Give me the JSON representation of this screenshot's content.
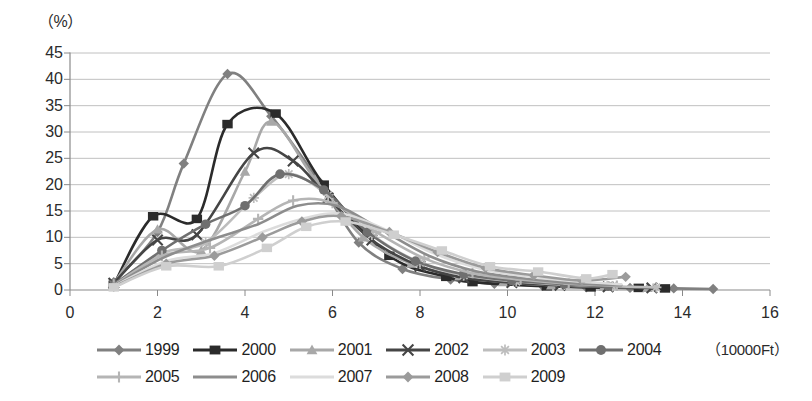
{
  "axes": {
    "y_unit": "（%）",
    "x_unit": "（10000Ft）",
    "y_ticks": [
      "0",
      "5",
      "10",
      "15",
      "20",
      "25",
      "30",
      "35",
      "40",
      "45"
    ],
    "x_ticks": [
      "0",
      "2",
      "4",
      "6",
      "8",
      "10",
      "12",
      "14",
      "16"
    ]
  },
  "legend": {
    "row1": [
      {
        "label": "1999",
        "marker": "diamond",
        "color": "#808080"
      },
      {
        "label": "2000",
        "marker": "square",
        "color": "#2b2b2b"
      },
      {
        "label": "2001",
        "marker": "triangle",
        "color": "#a8a8a8"
      },
      {
        "label": "2002",
        "marker": "cross-x",
        "color": "#454545"
      },
      {
        "label": "2003",
        "marker": "asterisk",
        "color": "#bdbdbd"
      },
      {
        "label": "2004",
        "marker": "circle",
        "color": "#6f6f6f"
      }
    ],
    "row2": [
      {
        "label": "2005",
        "marker": "plus",
        "color": "#b5b5b5"
      },
      {
        "label": "2006",
        "marker": "line",
        "color": "#8d8d8d"
      },
      {
        "label": "2007",
        "marker": "line",
        "color": "#dcdcdc"
      },
      {
        "label": "2008",
        "marker": "diamond",
        "color": "#9b9b9b"
      },
      {
        "label": "2009",
        "marker": "square",
        "color": "#cfcfcf"
      }
    ]
  },
  "chart_data": {
    "type": "line",
    "title": "",
    "xlabel": "（10000Ft）",
    "ylabel": "（%）",
    "xlim": [
      0,
      16
    ],
    "ylim": [
      0,
      45
    ],
    "xtick_step": 2,
    "ytick_step": 5,
    "grid": "horizontal",
    "legend_position": "bottom",
    "x": [
      1,
      2,
      3,
      4,
      5,
      6,
      7,
      8,
      9,
      10,
      11,
      12,
      13,
      14,
      15
    ],
    "series": [
      {
        "name": "1999",
        "color": "#808080",
        "marker": "diamond",
        "x": [
          1.0,
          2.0,
          2.6,
          3.6,
          4.6,
          5.7,
          6.6,
          7.6,
          8.7,
          9.7,
          10.8,
          11.8,
          12.8,
          13.8,
          14.7
        ],
        "values": [
          1.5,
          11.0,
          24.0,
          41.0,
          33.0,
          20.5,
          9.0,
          4.0,
          2.0,
          1.2,
          0.8,
          0.5,
          0.4,
          0.3,
          0.2
        ]
      },
      {
        "name": "2000",
        "color": "#2b2b2b",
        "marker": "square",
        "x": [
          1.0,
          1.9,
          2.9,
          3.6,
          4.7,
          5.8,
          7.3,
          8.6,
          9.2,
          10.9,
          11.9,
          13.0,
          13.6
        ],
        "values": [
          1.0,
          14.0,
          13.5,
          31.5,
          33.5,
          20.0,
          6.5,
          2.5,
          1.5,
          0.7,
          0.5,
          0.4,
          0.3
        ]
      },
      {
        "name": "2001",
        "color": "#a8a8a8",
        "marker": "triangle",
        "x": [
          1.0,
          2.0,
          3.0,
          4.0,
          4.6,
          5.6,
          6.7,
          7.8,
          8.9,
          9.9,
          11.0,
          12.2,
          13.2
        ],
        "values": [
          1.2,
          11.5,
          7.5,
          22.5,
          32.0,
          21.0,
          10.0,
          5.0,
          2.6,
          1.5,
          0.9,
          0.6,
          0.4
        ]
      },
      {
        "name": "2002",
        "color": "#454545",
        "marker": "cross-x",
        "x": [
          1.0,
          2.0,
          2.9,
          4.2,
          5.1,
          5.9,
          6.9,
          8.0,
          9.0,
          10.1,
          11.2,
          12.3,
          13.3
        ],
        "values": [
          1.3,
          9.5,
          10.5,
          26.0,
          24.5,
          17.5,
          9.5,
          4.5,
          2.3,
          1.4,
          0.9,
          0.6,
          0.4
        ]
      },
      {
        "name": "2003",
        "color": "#bdbdbd",
        "marker": "asterisk",
        "x": [
          1.0,
          2.1,
          3.1,
          4.2,
          5.0,
          5.9,
          6.9,
          8.0,
          9.0,
          10.2,
          11.3,
          12.4,
          13.4
        ],
        "values": [
          1.0,
          7.0,
          9.0,
          17.5,
          22.0,
          18.0,
          10.5,
          5.2,
          2.8,
          1.6,
          1.0,
          0.7,
          0.5
        ]
      },
      {
        "name": "2004",
        "color": "#6f6f6f",
        "marker": "circle",
        "x": [
          1.0,
          2.1,
          3.1,
          4.0,
          4.8,
          5.8,
          6.8,
          7.9,
          9.0,
          10.1,
          11.3,
          12.3
        ],
        "values": [
          1.0,
          7.5,
          12.5,
          16.0,
          22.0,
          19.0,
          11.0,
          5.5,
          3.0,
          1.8,
          1.1,
          0.7
        ]
      },
      {
        "name": "2005",
        "color": "#b5b5b5",
        "marker": "plus",
        "x": [
          1.0,
          2.1,
          3.2,
          4.3,
          5.1,
          6.0,
          7.0,
          8.1,
          9.2,
          10.3,
          11.4,
          12.5
        ],
        "values": [
          0.9,
          6.5,
          8.0,
          13.5,
          17.0,
          16.5,
          11.0,
          6.0,
          3.2,
          2.0,
          1.2,
          0.8
        ]
      },
      {
        "name": "2006",
        "color": "#8d8d8d",
        "marker": "line",
        "x": [
          1.0,
          2.1,
          3.2,
          4.3,
          5.2,
          6.1,
          7.1,
          8.2,
          9.3,
          10.4,
          11.5,
          12.6
        ],
        "values": [
          0.8,
          6.0,
          9.5,
          12.5,
          16.0,
          16.0,
          11.5,
          6.5,
          3.5,
          2.2,
          1.3,
          0.9
        ]
      },
      {
        "name": "2007",
        "color": "#dcdcdc",
        "marker": "line",
        "x": [
          1.0,
          2.2,
          3.3,
          4.4,
          5.3,
          6.2,
          7.2,
          8.3,
          9.4,
          10.5,
          11.6,
          12.6
        ],
        "values": [
          0.7,
          5.5,
          7.0,
          11.0,
          13.5,
          14.5,
          11.5,
          7.0,
          4.0,
          2.5,
          1.6,
          1.1
        ]
      },
      {
        "name": "2008",
        "color": "#9b9b9b",
        "marker": "diamond",
        "x": [
          1.0,
          2.2,
          3.3,
          4.4,
          5.3,
          6.2,
          7.3,
          8.4,
          9.5,
          10.6,
          11.7,
          12.7
        ],
        "values": [
          0.6,
          5.0,
          6.5,
          10.0,
          13.0,
          14.0,
          11.0,
          7.2,
          4.2,
          2.8,
          1.8,
          2.5
        ]
      },
      {
        "name": "2009",
        "color": "#cfcfcf",
        "marker": "square",
        "x": [
          1.0,
          2.2,
          3.4,
          4.5,
          5.4,
          6.3,
          7.4,
          8.5,
          9.6,
          10.7,
          11.8,
          12.4
        ],
        "values": [
          0.5,
          4.5,
          4.5,
          8.0,
          12.0,
          13.0,
          10.5,
          7.5,
          4.5,
          3.5,
          2.2,
          3.0
        ]
      }
    ]
  }
}
